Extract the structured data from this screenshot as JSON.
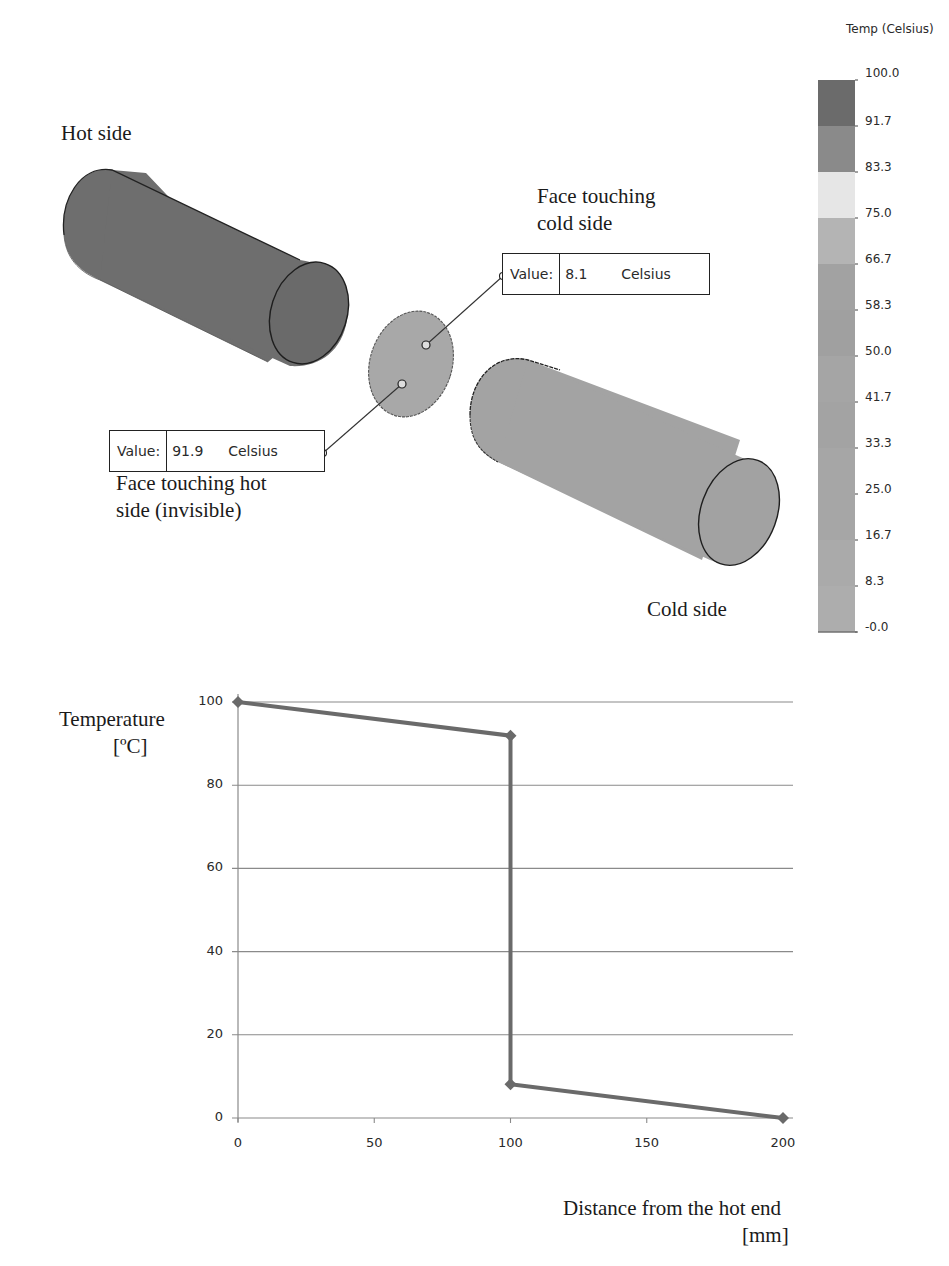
{
  "scene": {
    "labels": {
      "hot_side": "Hot side",
      "cold_side": "Cold side",
      "face_cold_line1": "Face touching",
      "face_cold_line2": "cold side",
      "face_hot_line1": "Face touching hot",
      "face_hot_line2": "side (invisible)"
    },
    "probes": [
      {
        "key": "Value:",
        "value": "8.1",
        "unit": "Celsius"
      },
      {
        "key": "Value:",
        "value": "91.9",
        "unit": "Celsius"
      }
    ],
    "colors": {
      "hot_cylinder": "#6e6e6e",
      "cold_cylinder": "#a3a3a3",
      "disc": "#a8a8a8"
    }
  },
  "legend": {
    "title": "Temp (Celsius)",
    "ticks": [
      "100.0",
      "91.7",
      "83.3",
      "75.0",
      "66.7",
      "58.3",
      "50.0",
      "41.7",
      "33.3",
      "25.0",
      "16.7",
      "8.3",
      "-0.0"
    ],
    "band_colors": [
      "#6b6b6b",
      "#8a8a8a",
      "#e6e6e6",
      "#b4b4b4",
      "#a2a2a2",
      "#a0a0a0",
      "#a5a5a5",
      "#a3a3a3",
      "#a6a6a6",
      "#a6a6a6",
      "#aaaaaa",
      "#adadad"
    ]
  },
  "chart": {
    "ylabel_line1": "Temperature",
    "ylabel_line2": "[ºC]",
    "xlabel_line1": "Distance from the hot end",
    "xlabel_line2": "[mm]",
    "yticks": [
      "100",
      "80",
      "60",
      "40",
      "20",
      "0"
    ],
    "xticks": [
      "0",
      "50",
      "100",
      "150",
      "200"
    ]
  },
  "chart_data": {
    "type": "line",
    "title": "",
    "xlabel": "Distance from the hot end [mm]",
    "ylabel": "Temperature [ºC]",
    "xlim": [
      0,
      200
    ],
    "ylim": [
      0,
      100
    ],
    "grid": true,
    "legend": null,
    "series": [
      {
        "name": "Temperature",
        "color": "#6a6a6a",
        "marker": "diamond",
        "x": [
          0,
          100,
          100,
          200
        ],
        "y": [
          100,
          91.9,
          8.1,
          0
        ]
      }
    ],
    "x_ticks": [
      0,
      50,
      100,
      150,
      200
    ],
    "y_ticks": [
      0,
      20,
      40,
      60,
      80,
      100
    ]
  }
}
